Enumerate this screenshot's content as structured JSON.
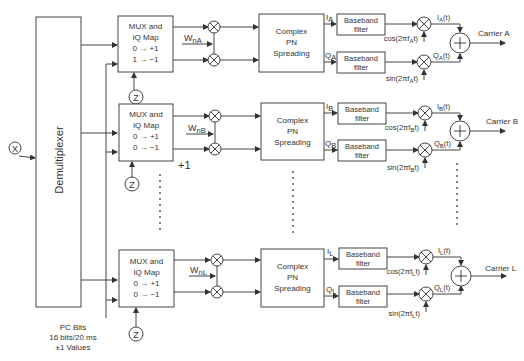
{
  "diagram": {
    "input_label": "X",
    "demux_label": "Demultiplexer",
    "pc_bits": {
      "line1": "PC Bits",
      "line2": "16 bits/20 ms",
      "line3": "±1 Values"
    },
    "extra_label": "+1",
    "z_label": "Z",
    "branches": [
      {
        "id": "A",
        "mux": {
          "l1": "MUX and",
          "l2": "IQ Map",
          "l3": "0 → +1",
          "l4": "1 → −1"
        },
        "walsh": "W",
        "walsh_sub": "nA",
        "pn": {
          "l1": "Complex",
          "l2": "PN",
          "l3": "Spreading"
        },
        "i_label": "I",
        "i_sub": "A",
        "q_label": "Q",
        "q_sub": "A",
        "filter": {
          "l1": "Baseband",
          "l2": "filter"
        },
        "cos": "cos(2πf",
        "cos_sub": "A",
        "cos_end": "t)",
        "sin": "sin(2πf",
        "sin_sub": "A",
        "sin_end": "t)",
        "it": "I",
        "it_sub": "A",
        "it_end": "(t)",
        "qt": "Q",
        "qt_sub": "A",
        "qt_end": "(t)",
        "carrier": "Carrier A"
      },
      {
        "id": "B",
        "mux": {
          "l1": "MUX and",
          "l2": "IQ Map",
          "l3": "0 → +1",
          "l4": "0 → −1"
        },
        "walsh": "W",
        "walsh_sub": "nB",
        "pn": {
          "l1": "Complex",
          "l2": "PN",
          "l3": "Spreading"
        },
        "i_label": "I",
        "i_sub": "B",
        "q_label": "Q",
        "q_sub": "B",
        "filter": {
          "l1": "Baseband",
          "l2": "filter"
        },
        "cos": "cos(2πf",
        "cos_sub": "B",
        "cos_end": "t)",
        "sin": "sin(2πf",
        "sin_sub": "B",
        "sin_end": "t)",
        "it": "I",
        "it_sub": "B",
        "it_end": "(t)",
        "qt": "Q",
        "qt_sub": "B",
        "qt_end": "(t)",
        "carrier": "Carrier B"
      },
      {
        "id": "L",
        "mux": {
          "l1": "MUX and",
          "l2": "IQ Map",
          "l3": "0 → +1",
          "l4": "0 → −1"
        },
        "walsh": "W",
        "walsh_sub": "nL",
        "pn": {
          "l1": "Complex",
          "l2": "PN",
          "l3": "Spreading"
        },
        "i_label": "I",
        "i_sub": "L",
        "q_label": "Q",
        "q_sub": "L",
        "filter": {
          "l1": "Baseband",
          "l2": "filter"
        },
        "cos": "cos(2πf",
        "cos_sub": "L",
        "cos_end": "t)",
        "sin": "sin(2πf",
        "sin_sub": "L",
        "sin_end": "t)",
        "it": "I",
        "it_sub": "L",
        "it_end": "(t)",
        "qt": "Q",
        "qt_sub": "L",
        "qt_end": "(t)",
        "carrier": "Carrier L"
      }
    ]
  }
}
